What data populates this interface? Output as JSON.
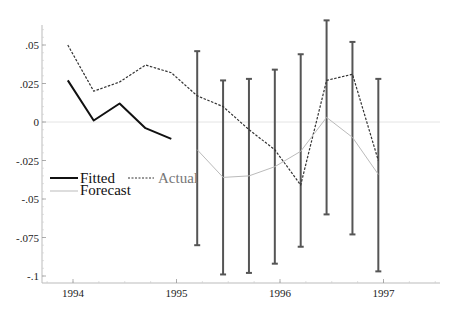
{
  "chart_data": {
    "type": "line",
    "title": "",
    "xlabel": "",
    "ylabel": "",
    "xlim": [
      1993.85,
      1997.55
    ],
    "ylim": [
      -0.105,
      0.065
    ],
    "grid": false,
    "legend_position": "left-middle",
    "x_ticks": [
      {
        "value": 1994,
        "label": "1994"
      },
      {
        "value": 1995,
        "label": "1995"
      },
      {
        "value": 1996,
        "label": "1996"
      },
      {
        "value": 1997,
        "label": "1997"
      }
    ],
    "y_ticks": [
      {
        "value": 0.05,
        "label": ".05"
      },
      {
        "value": 0.025,
        "label": ".025"
      },
      {
        "value": 0,
        "label": "0"
      },
      {
        "value": -0.025,
        "label": "-.025"
      },
      {
        "value": -0.05,
        "label": "-.05"
      },
      {
        "value": -0.075,
        "label": "-.075"
      },
      {
        "value": -0.1,
        "label": "-.1"
      }
    ],
    "zero_line": true,
    "series": [
      {
        "name": "Fitted",
        "style": "solid",
        "color": "#111111",
        "width": 2,
        "x": [
          1993.95,
          1994.2,
          1994.45,
          1994.7,
          1994.95
        ],
        "values": [
          0.027,
          0.001,
          0.012,
          -0.004,
          -0.011
        ]
      },
      {
        "name": "Actual",
        "style": "dashed",
        "color": "#333333",
        "width": 1.2,
        "x": [
          1993.95,
          1994.2,
          1994.45,
          1994.7,
          1994.95,
          1995.2,
          1995.45,
          1995.7,
          1995.95,
          1996.2,
          1996.45,
          1996.7,
          1996.95
        ],
        "values": [
          0.05,
          0.02,
          0.026,
          0.037,
          0.032,
          0.017,
          0.01,
          -0.005,
          -0.018,
          -0.041,
          0.027,
          0.031,
          -0.025
        ]
      },
      {
        "name": "Forecast",
        "style": "solid",
        "color": "#bbbbbb",
        "width": 1,
        "x": [
          1995.2,
          1995.45,
          1995.7,
          1995.95,
          1996.2,
          1996.45,
          1996.7,
          1996.95
        ],
        "values": [
          -0.018,
          -0.036,
          -0.035,
          -0.029,
          -0.019,
          0.003,
          -0.01,
          -0.034
        ]
      }
    ],
    "error_bars": {
      "name": "Forecast interval",
      "color": "#555555",
      "x": [
        1995.2,
        1995.45,
        1995.7,
        1995.95,
        1996.2,
        1996.45,
        1996.7,
        1996.95
      ],
      "upper": [
        0.046,
        0.027,
        0.028,
        0.034,
        0.044,
        0.066,
        0.052,
        0.028
      ],
      "lower": [
        -0.08,
        -0.099,
        -0.098,
        -0.092,
        -0.081,
        -0.06,
        -0.073,
        -0.097
      ]
    }
  },
  "legend": {
    "fitted": "Fitted",
    "actual": "Actual",
    "forecast": "Forecast"
  }
}
